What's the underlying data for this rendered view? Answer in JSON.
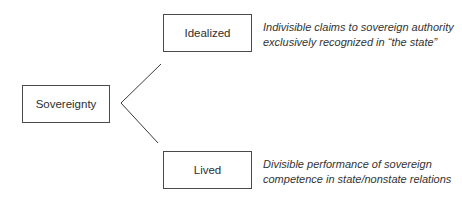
{
  "diagram": {
    "root": {
      "label": "Sovereignty"
    },
    "branches": [
      {
        "label": "Idealized",
        "description": {
          "line1": "Indivisible claims to sovereign authority",
          "line2": "exclusively recognized in “the state”"
        }
      },
      {
        "label": "Lived",
        "description": {
          "line1": "Divisible performance of sovereign",
          "line2": "competence in state/nonstate relations"
        }
      }
    ],
    "colors": {
      "line": "#3a3a3a",
      "border": "#4a4a4a",
      "text": "#2e2e2e"
    }
  }
}
